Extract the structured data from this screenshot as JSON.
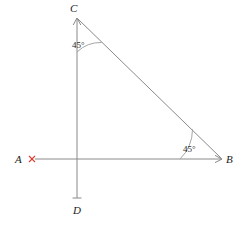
{
  "figure": {
    "background_color": "#ffffff",
    "line_color": "#8a8a8a",
    "label_color": "#1a1a1a",
    "mark_color": "#e03a2f",
    "points": {
      "A": {
        "label": "A",
        "x": 20,
        "y": 159
      },
      "B": {
        "label": "B",
        "x": 229,
        "y": 159
      },
      "C": {
        "label": "C",
        "x": 74,
        "y": 10
      },
      "D": {
        "label": "D",
        "x": 78,
        "y": 209
      }
    },
    "vertices": {
      "apex": {
        "x": 77,
        "y": 18
      },
      "origin": {
        "x": 77,
        "y": 159
      },
      "right": {
        "x": 222,
        "y": 159
      },
      "bottom": {
        "x": 77,
        "y": 198
      }
    },
    "angles": [
      {
        "name": "angle-at-C",
        "value": "45°",
        "x": 82,
        "y": 47
      },
      {
        "name": "angle-at-B",
        "value": "45°",
        "x": 193,
        "y": 151
      }
    ],
    "mark": {
      "name": "point-a-cross",
      "symbol": "×",
      "x": 32,
      "y": 159
    }
  }
}
